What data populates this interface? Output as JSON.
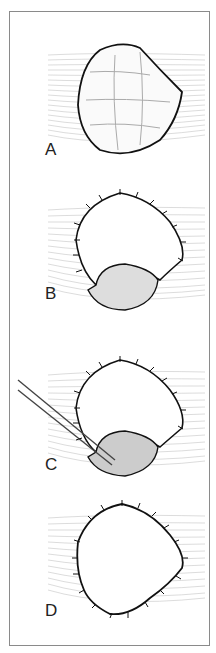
{
  "figure": {
    "panels": [
      {
        "label": "A",
        "caption": "Open wound with granulation/fibrinous base, unsutured"
      },
      {
        "label": "B",
        "caption": "Wound margins sutured except lower portion"
      },
      {
        "label": "C",
        "caption": "Forceps debriding remaining lower pocket"
      },
      {
        "label": "D",
        "caption": "Wound fully sutured around circumference"
      }
    ]
  },
  "colors": {
    "frame": "#8a8a8a",
    "outline": "#111111",
    "tissue_lines": "#b5b5b5",
    "shadow": "#9a9a9a"
  }
}
